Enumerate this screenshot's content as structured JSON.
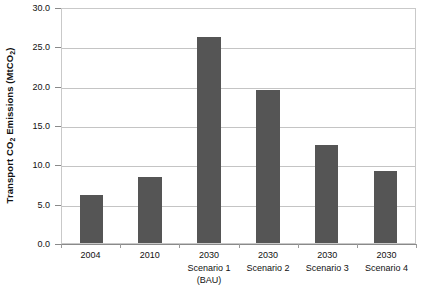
{
  "chart_data": {
    "type": "bar",
    "title": "",
    "xlabel": "",
    "ylabel": "Transport CO2 Emissions (MtCO2)",
    "ylabel_parts": {
      "pre": "Transport CO",
      "sub1": "2",
      "mid": " Emissions (MtCO",
      "sub2": "2",
      "post": ")"
    },
    "categories": [
      "2004",
      "2010",
      "2030 Scenario 1 (BAU)",
      "2030 Scenario 2",
      "2030 Scenario 3",
      "2030 Scenario 4"
    ],
    "category_label_lines": [
      [
        "2004"
      ],
      [
        "2010"
      ],
      [
        "2030",
        "Scenario 1",
        "(BAU)"
      ],
      [
        "2030",
        "Scenario 2"
      ],
      [
        "2030",
        "Scenario 3"
      ],
      [
        "2030",
        "Scenario 4"
      ]
    ],
    "values": [
      6.1,
      8.4,
      26.2,
      19.5,
      12.4,
      9.2
    ],
    "ylim": [
      0.0,
      30.0
    ],
    "ytick_values": [
      0.0,
      5.0,
      10.0,
      15.0,
      20.0,
      25.0,
      30.0
    ],
    "ytick_labels": [
      "0.0",
      "5.0",
      "10.0",
      "15.0",
      "20.0",
      "25.0",
      "30.0"
    ],
    "grid": true,
    "grid_axis": "y",
    "legend": false,
    "legend_position": "none",
    "bar_color": "#555555",
    "grid_color": "#c4c4c4",
    "axis_color": "#8a8a8a",
    "plot_border_color": "#c9c9c9",
    "background_color": "#ffffff",
    "text_color": "#111111"
  }
}
